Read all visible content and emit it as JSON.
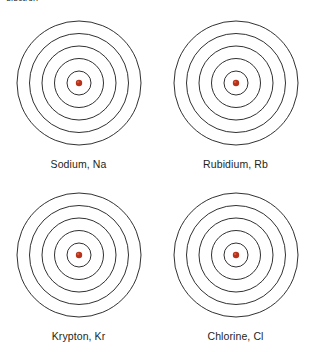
{
  "page": {
    "background_color": "#ffffff",
    "width": 314,
    "height": 352,
    "top_clipped_text": "electron"
  },
  "style": {
    "shell_stroke_color": "#1a1a1a",
    "shell_stroke_width": 0.9,
    "nucleus_color": "#b5331a",
    "nucleus_highlight_color": "#d8553a",
    "label_color": "#231f20"
  },
  "diagrams": [
    {
      "id": "sodium",
      "label": "Sodium, Na",
      "element_name": "Sodium",
      "symbol": "Na",
      "shell_count": 5,
      "shell_radii": [
        12,
        24.5,
        37,
        49.5,
        62
      ],
      "nucleus_radius": 3.2,
      "position": "top-left"
    },
    {
      "id": "rubidium",
      "label": "Rubidium, Rb",
      "element_name": "Rubidium",
      "symbol": "Rb",
      "shell_count": 5,
      "shell_radii": [
        12,
        24.5,
        37,
        49.5,
        62
      ],
      "nucleus_radius": 3.2,
      "position": "top-right"
    },
    {
      "id": "krypton",
      "label": "Krypton, Kr",
      "element_name": "Krypton",
      "symbol": "Kr",
      "shell_count": 5,
      "shell_radii": [
        12,
        24.5,
        37,
        49.5,
        62
      ],
      "nucleus_radius": 3.2,
      "position": "bottom-left"
    },
    {
      "id": "chlorine",
      "label": "Chlorine, Cl",
      "element_name": "Chlorine",
      "symbol": "Cl",
      "shell_count": 5,
      "shell_radii": [
        12,
        24.5,
        37,
        49.5,
        62
      ],
      "nucleus_radius": 3.2,
      "position": "bottom-right"
    }
  ]
}
